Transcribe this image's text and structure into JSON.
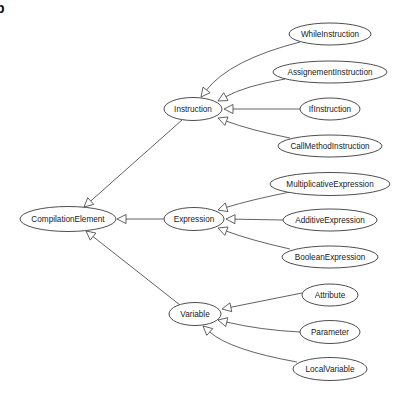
{
  "panel_label": "b",
  "diagram": {
    "type": "class-inheritance-tree",
    "root": "CompilationElement",
    "nodes": [
      {
        "id": "CompilationElement",
        "label": "CompilationElement"
      },
      {
        "id": "Instruction",
        "label": "Instruction"
      },
      {
        "id": "Expression",
        "label": "Expression"
      },
      {
        "id": "Variable",
        "label": "Variable"
      },
      {
        "id": "WhileInstruction",
        "label": "WhileInstruction"
      },
      {
        "id": "AssignementInstruction",
        "label": "AssignementInstruction"
      },
      {
        "id": "IfInstruction",
        "label": "IfInstruction"
      },
      {
        "id": "CallMethodInstruction",
        "label": "CallMethodInstruction"
      },
      {
        "id": "MultiplicativeExpression",
        "label": "MultiplicativeExpression"
      },
      {
        "id": "AdditiveExpression",
        "label": "AdditiveExpression"
      },
      {
        "id": "BooleanExpression",
        "label": "BooleanExpression"
      },
      {
        "id": "Attribute",
        "label": "Attribute"
      },
      {
        "id": "Parameter",
        "label": "Parameter"
      },
      {
        "id": "LocalVariable",
        "label": "LocalVariable"
      }
    ],
    "edges": [
      {
        "from": "Instruction",
        "to": "CompilationElement",
        "relation": "inherits"
      },
      {
        "from": "Expression",
        "to": "CompilationElement",
        "relation": "inherits"
      },
      {
        "from": "Variable",
        "to": "CompilationElement",
        "relation": "inherits"
      },
      {
        "from": "WhileInstruction",
        "to": "Instruction",
        "relation": "inherits"
      },
      {
        "from": "AssignementInstruction",
        "to": "Instruction",
        "relation": "inherits"
      },
      {
        "from": "IfInstruction",
        "to": "Instruction",
        "relation": "inherits"
      },
      {
        "from": "CallMethodInstruction",
        "to": "Instruction",
        "relation": "inherits"
      },
      {
        "from": "MultiplicativeExpression",
        "to": "Expression",
        "relation": "inherits"
      },
      {
        "from": "AdditiveExpression",
        "to": "Expression",
        "relation": "inherits"
      },
      {
        "from": "BooleanExpression",
        "to": "Expression",
        "relation": "inherits"
      },
      {
        "from": "Attribute",
        "to": "Variable",
        "relation": "inherits"
      },
      {
        "from": "Parameter",
        "to": "Variable",
        "relation": "inherits"
      },
      {
        "from": "LocalVariable",
        "to": "Variable",
        "relation": "inherits"
      }
    ]
  }
}
